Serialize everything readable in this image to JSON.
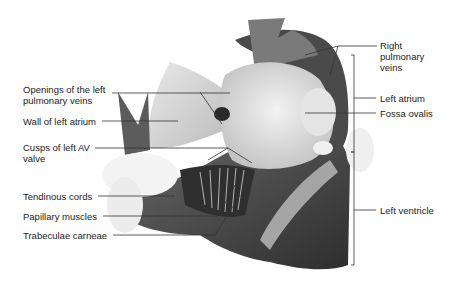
{
  "figure": {
    "labels_left": [
      {
        "text": "Openings of the left\npulmonary veins",
        "line1": "Openings of the left",
        "line2": "pulmonary veins"
      },
      {
        "text": "Wall of left atrium"
      },
      {
        "text": "Cusps of left AV\nvalve",
        "line1": "Cusps of left AV",
        "line2": "valve"
      },
      {
        "text": "Tendinous cords"
      },
      {
        "text": "Papillary muscles"
      },
      {
        "text": "Trabeculae carneae"
      }
    ],
    "labels_right": [
      {
        "text": "Right\npulmonary\nveins",
        "line1": "Right",
        "line2": "pulmonary",
        "line3": "veins"
      },
      {
        "text": "Left atrium"
      },
      {
        "text": "Fossa ovalis"
      },
      {
        "text": "Left ventricle"
      }
    ],
    "colors": {
      "background": "#ffffff",
      "label_text": "#222222",
      "leader_line": "#333333",
      "tissue_light": "#d8d8d8",
      "tissue_mid": "#8a8a8a",
      "tissue_dark": "#3c3c3c"
    }
  }
}
